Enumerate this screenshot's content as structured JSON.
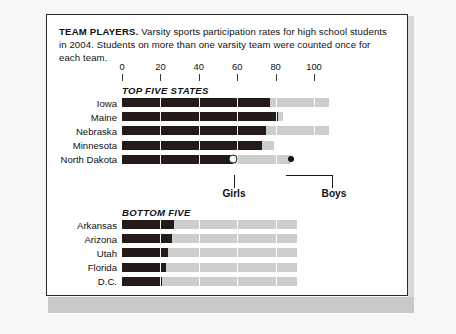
{
  "caption": {
    "lead": "TEAM PLAYERS.",
    "body": " Varsity sports participation rates for high school students in 2004. Students on more than one varsity team were counted once for each team."
  },
  "chart_data": {
    "type": "bar",
    "title": "TEAM PLAYERS",
    "subtitle": "Varsity sports participation rates for high school students in 2004.",
    "xlabel": "",
    "ylabel": "",
    "xlim": [
      0,
      110
    ],
    "ticks": [
      0,
      20,
      40,
      60,
      80,
      100
    ],
    "tick_labels": [
      "0",
      "20",
      "40",
      "60",
      "80",
      "100"
    ],
    "grid": true,
    "orientation": "horizontal",
    "legend_position": "inline-callout",
    "series": [
      {
        "name": "Girls",
        "color": "#241a18"
      },
      {
        "name": "Boys",
        "color": "#cdcdcb"
      }
    ],
    "groups": [
      {
        "label": "TOP FIVE STATES",
        "categories": [
          "Iowa",
          "Maine",
          "Nebraska",
          "Minnesota",
          "North Dakota"
        ],
        "girls": [
          77,
          81,
          75,
          73,
          58
        ],
        "boys": [
          108,
          84,
          108,
          79,
          88
        ],
        "markers": {
          "North Dakota": {
            "girls_dot": true,
            "boys_dot": true
          }
        }
      },
      {
        "label": "BOTTOM FIVE",
        "categories": [
          "Arkansas",
          "Arizona",
          "Utah",
          "Florida",
          "D.C."
        ],
        "girls": [
          27,
          26,
          24,
          23,
          21
        ],
        "boys": [
          91,
          91,
          91,
          91,
          91
        ]
      }
    ],
    "annotations": [
      {
        "text": "Girls",
        "points_to": "North Dakota girls bar end"
      },
      {
        "text": "Boys",
        "points_to": "North Dakota boys bar end"
      }
    ]
  },
  "axis": {
    "labels": [
      "0",
      "20",
      "40",
      "60",
      "80",
      "100"
    ]
  },
  "sections": {
    "top_title": "TOP FIVE STATES",
    "bottom_title": "BOTTOM FIVE"
  },
  "callouts": {
    "girls": "Girls",
    "boys": "Boys"
  },
  "colors": {
    "girls_bar": "#241a18",
    "boys_bar": "#cdcdcb",
    "frame": "#2a2a2a",
    "page": "#f7f7f6"
  }
}
